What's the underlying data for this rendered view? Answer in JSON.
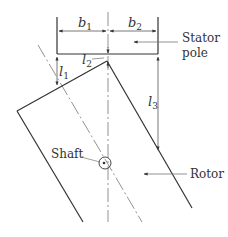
{
  "diagram": {
    "type": "stator-rotor-geometry",
    "labels": {
      "b1": "b",
      "b1_sub": "1",
      "b2": "b",
      "b2_sub": "2",
      "l1": "l",
      "l1_sub": "1",
      "l2": "l",
      "l2_sub": "2",
      "l3": "l",
      "l3_sub": "3",
      "stator_line1": "Stator",
      "stator_line2": "pole",
      "shaft": "Shaft",
      "rotor": "Rotor"
    },
    "colors": {
      "line": "#333333",
      "thin_line": "#777777",
      "text": "#333333"
    }
  }
}
